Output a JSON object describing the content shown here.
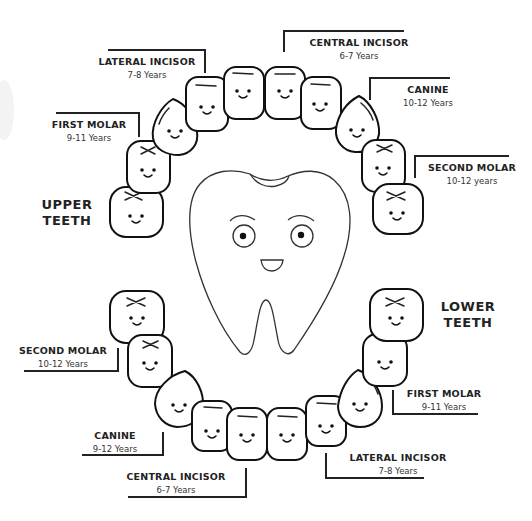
{
  "diagram": {
    "groups": {
      "upper": "UPPER\nTEETH",
      "upper_line1": "UPPER",
      "upper_line2": "TEETH",
      "lower_line1": "LOWER",
      "lower_line2": "TEETH"
    },
    "upper_labels": [
      {
        "name": "LATERAL INCISOR",
        "age": "7-8 Years"
      },
      {
        "name": "CENTRAL INCISOR",
        "age": "6-7 Years"
      },
      {
        "name": "FIRST MOLAR",
        "age": "9-11 Years"
      },
      {
        "name": "CANINE",
        "age": "10-12 Years"
      },
      {
        "name": "SECOND MOLAR",
        "age": "10-12 years"
      }
    ],
    "lower_labels": [
      {
        "name": "SECOND MOLAR",
        "age": "10-12 Years"
      },
      {
        "name": "FIRST MOLAR",
        "age": "9-11 Years"
      },
      {
        "name": "CANINE",
        "age": "9-12 Years"
      },
      {
        "name": "LATERAL INCISOR",
        "age": "7-8 Years"
      },
      {
        "name": "CENTRAL INCISOR",
        "age": "6-7 Years"
      }
    ],
    "central_character": "smiling-tooth-mascot",
    "colors": {
      "stroke": "#222222",
      "background": "#ffffff"
    }
  }
}
